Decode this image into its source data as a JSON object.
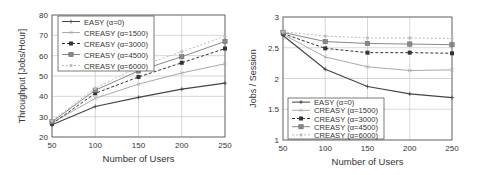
{
  "chart_data": [
    {
      "type": "line",
      "title": "",
      "xlabel": "Number of Users",
      "ylabel": "Throughput [Jobs/Hour]",
      "x": [
        50,
        100,
        150,
        200,
        250
      ],
      "xticks": [
        "50",
        "100",
        "150",
        "200",
        "250"
      ],
      "yticks": [
        "20",
        "30",
        "40",
        "50",
        "60",
        "70",
        "80"
      ],
      "xlim": [
        50,
        250
      ],
      "ylim": [
        20,
        80
      ],
      "grid": true,
      "legend_position": "upper left",
      "series": [
        {
          "name": "EASY (α=0)",
          "values": [
            26,
            35,
            39.5,
            43.5,
            46.5
          ],
          "color": "#444444",
          "marker": "plus",
          "dash": ""
        },
        {
          "name": "CREASY (α=1500)",
          "values": [
            27,
            39,
            46,
            51.5,
            56
          ],
          "color": "#aaaaaa",
          "marker": "x",
          "dash": ""
        },
        {
          "name": "CREASY (α=3000)",
          "values": [
            26.5,
            41.5,
            49.5,
            56.5,
            63.5
          ],
          "color": "#333333",
          "marker": "filled-square",
          "dash": "3,2"
        },
        {
          "name": "CREASY (α=4500)",
          "values": [
            27.5,
            43,
            52.5,
            59.5,
            67
          ],
          "color": "#888888",
          "marker": "square",
          "dash": ""
        },
        {
          "name": "CREASY (α=6000)",
          "values": [
            28,
            44,
            54.5,
            62,
            69.5
          ],
          "color": "#bbbbbb",
          "marker": "dot",
          "dash": "2,2"
        }
      ]
    },
    {
      "type": "line",
      "title": "",
      "xlabel": "Number of Users",
      "ylabel": "Jobs / Session",
      "x": [
        50,
        100,
        150,
        200,
        250
      ],
      "xticks": [
        "50",
        "100",
        "150",
        "200",
        "250"
      ],
      "yticks": [
        "1",
        "1.5",
        "2",
        "2.5",
        "3"
      ],
      "xlim": [
        50,
        250
      ],
      "ylim": [
        1,
        3
      ],
      "grid": true,
      "legend_position": "lower left",
      "series": [
        {
          "name": "EASY (α=0)",
          "values": [
            2.7,
            2.15,
            1.87,
            1.75,
            1.69
          ],
          "color": "#444444",
          "marker": "plus",
          "dash": ""
        },
        {
          "name": "CREASY (α=1500)",
          "values": [
            2.72,
            2.35,
            2.19,
            2.13,
            2.14
          ],
          "color": "#aaaaaa",
          "marker": "x",
          "dash": ""
        },
        {
          "name": "CREASY (α=3000)",
          "values": [
            2.73,
            2.49,
            2.42,
            2.42,
            2.41
          ],
          "color": "#333333",
          "marker": "filled-square",
          "dash": "3,2"
        },
        {
          "name": "CREASY (α=4500)",
          "values": [
            2.75,
            2.6,
            2.57,
            2.56,
            2.55
          ],
          "color": "#888888",
          "marker": "square",
          "dash": ""
        },
        {
          "name": "CREASY (α=6000)",
          "values": [
            2.76,
            2.69,
            2.66,
            2.66,
            2.65
          ],
          "color": "#bbbbbb",
          "marker": "dot",
          "dash": "2,2"
        }
      ]
    }
  ]
}
